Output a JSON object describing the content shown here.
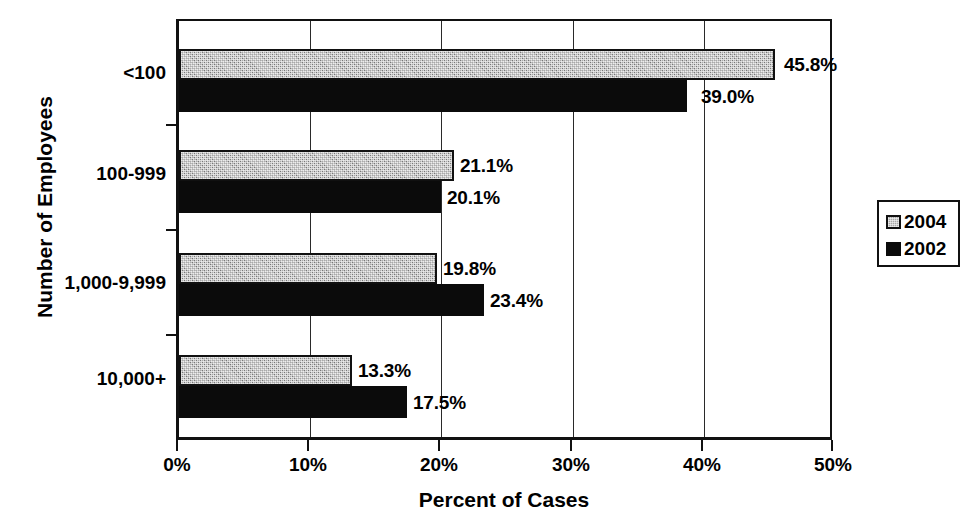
{
  "chart_data": {
    "type": "bar",
    "orientation": "horizontal",
    "title": "",
    "xlabel": "Percent of Cases",
    "ylabel": "Number of Employees",
    "categories": [
      "<100",
      "100-999",
      "1,000-9,999",
      "10,000+"
    ],
    "series": [
      {
        "name": "2004",
        "color": "#a9a9a9",
        "values": [
          45.8,
          21.1,
          19.8,
          13.3
        ],
        "labels": [
          "45.8%",
          "21.1%",
          "19.8%",
          "13.3%"
        ]
      },
      {
        "name": "2002",
        "color": "#000000",
        "values": [
          39.0,
          20.1,
          23.4,
          17.5
        ],
        "labels": [
          "39.0%",
          "20.1%",
          "23.4%",
          "17.5%"
        ]
      }
    ],
    "xlim": [
      0,
      50
    ],
    "xticks": [
      0,
      10,
      20,
      30,
      40,
      50
    ],
    "xtick_labels": [
      "0%",
      "10%",
      "20%",
      "30%",
      "40%",
      "50%"
    ],
    "grid": "vertical",
    "legend_position": "right",
    "legend_entries": [
      "2004",
      "2002"
    ]
  }
}
